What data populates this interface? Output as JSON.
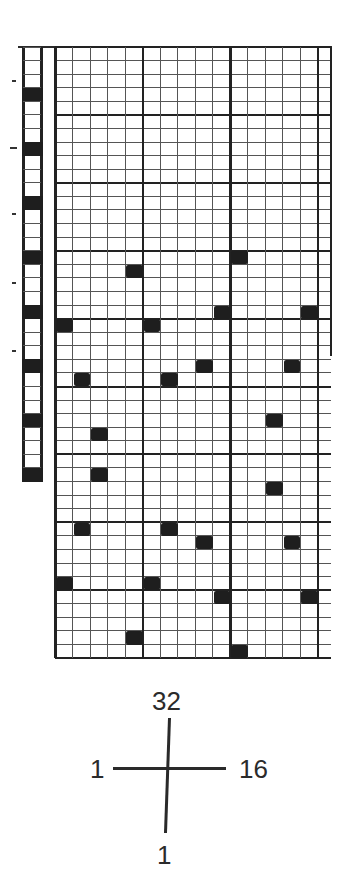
{
  "chart_data": {
    "type": "grid-pattern",
    "title": "",
    "main_grid": {
      "columns": 16,
      "rows": 45,
      "block_size": 5,
      "origin": "top-left, row 1 = top",
      "filled_cells": [
        {
          "row": 16,
          "col": 11
        },
        {
          "row": 17,
          "col": 5
        },
        {
          "row": 20,
          "col": 10
        },
        {
          "row": 20,
          "col": 15
        },
        {
          "row": 21,
          "col": 1
        },
        {
          "row": 21,
          "col": 6
        },
        {
          "row": 24,
          "col": 9
        },
        {
          "row": 24,
          "col": 14
        },
        {
          "row": 25,
          "col": 2
        },
        {
          "row": 25,
          "col": 7
        },
        {
          "row": 28,
          "col": 13
        },
        {
          "row": 29,
          "col": 3
        },
        {
          "row": 32,
          "col": 3
        },
        {
          "row": 33,
          "col": 13
        },
        {
          "row": 36,
          "col": 2
        },
        {
          "row": 36,
          "col": 7
        },
        {
          "row": 37,
          "col": 9
        },
        {
          "row": 37,
          "col": 14
        },
        {
          "row": 40,
          "col": 1
        },
        {
          "row": 40,
          "col": 6
        },
        {
          "row": 41,
          "col": 10
        },
        {
          "row": 41,
          "col": 15
        },
        {
          "row": 44,
          "col": 5
        },
        {
          "row": 45,
          "col": 11
        }
      ],
      "right_border_rows": 22
    },
    "side_strip": {
      "rows": 32,
      "filled_rows": [
        4,
        8,
        12,
        16,
        20,
        24,
        28,
        32
      ],
      "tick_marks_y": [
        80,
        147,
        213,
        282,
        350
      ]
    },
    "axis_key": {
      "top_label": "32",
      "bottom_label": "1",
      "left_label": "1",
      "right_label": "16"
    }
  },
  "colors": {
    "ink": "#1e1e1e",
    "grid_line": "#555555",
    "background": "#ffffff"
  }
}
